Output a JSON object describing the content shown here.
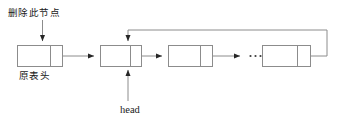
{
  "diagram": {
    "type": "circular-linked-list-deletion",
    "title_visible": false,
    "background_color": "#ffffff",
    "stroke_color": "#808080",
    "text_color": "#1a1a1a",
    "labels": {
      "delete_node": "删除此节点",
      "old_list_head": "原表头",
      "head_pointer": "head"
    },
    "ellipsis": "...",
    "nodes": [
      {
        "id": "node-removed",
        "x": 17,
        "y": 45,
        "width": 45,
        "height": 21,
        "divider_x": 50,
        "role": "deleted-original-head"
      },
      {
        "id": "node-head",
        "x": 100,
        "y": 45,
        "width": 41,
        "height": 21,
        "divider_x": 130,
        "role": "new-head"
      },
      {
        "id": "node-third",
        "x": 168,
        "y": 45,
        "width": 44,
        "height": 21,
        "divider_x": 200,
        "role": "middle"
      },
      {
        "id": "node-last",
        "x": 262,
        "y": 45,
        "width": 48,
        "height": 21,
        "divider_x": 297,
        "role": "tail"
      }
    ],
    "arrows": [
      {
        "id": "arrow-delete-label",
        "from": "删除此节点",
        "to": "node-removed",
        "direction": "down"
      },
      {
        "id": "arrow-removed-to-head",
        "from": "node-removed",
        "to": "node-head",
        "direction": "right"
      },
      {
        "id": "arrow-head-to-third",
        "from": "node-head",
        "to": "node-third",
        "direction": "right"
      },
      {
        "id": "arrow-third-to-ellipsis",
        "from": "node-third",
        "to": "ellipsis",
        "direction": "right"
      },
      {
        "id": "arrow-head-label",
        "from": "head",
        "to": "node-head",
        "direction": "up"
      },
      {
        "id": "arrow-loopback",
        "from": "node-last",
        "to": "node-head",
        "direction": "wrap-around-top"
      }
    ]
  }
}
